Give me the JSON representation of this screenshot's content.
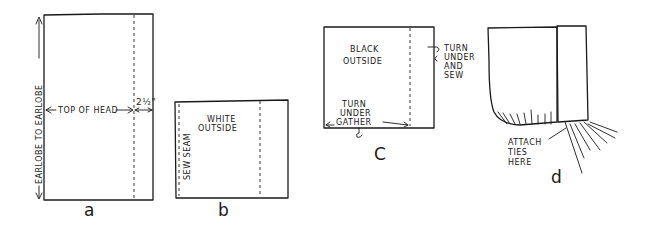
{
  "figures": {
    "a": {
      "label": "a",
      "vertical_dimension": "EARLOBE TO EARLOBE",
      "horizontal_dimension": "TOP OF HEAD",
      "allowance": "2½\""
    },
    "b": {
      "label": "b",
      "side_note": "SEW SEAM",
      "center_note_line1": "WHITE",
      "center_note_line2": "OUTSIDE"
    },
    "c": {
      "label": "C",
      "center_note_line1": "BLACK",
      "center_note_line2": "OUTSIDE",
      "right_note_line1": "TURN",
      "right_note_line2": "UNDER",
      "right_note_line3": "AND",
      "right_note_line4": "SEW",
      "bottom_note_line1": "TURN",
      "bottom_note_line2": "UNDER",
      "bottom_note_line3": "GATHER"
    },
    "d": {
      "label": "d",
      "note_line1": "ATTACH",
      "note_line2": "TIES",
      "note_line3": "HERE"
    }
  }
}
